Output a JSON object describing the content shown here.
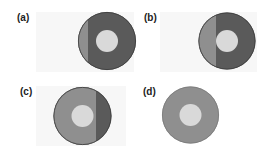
{
  "colors": {
    "dark": "#5a5a5a",
    "medium": "#8f8f8f",
    "inner": "#d9d9d9",
    "outline": "#3a3a3a"
  },
  "panels": [
    {
      "label": "(a)",
      "cx": 107,
      "cy": 41,
      "r": 29,
      "inner_r": 11,
      "split_x": 88,
      "light_side": "left"
    },
    {
      "label": "(b)",
      "cx": 227,
      "cy": 41,
      "r": 28.5,
      "inner_r": 11,
      "split_x": 216,
      "light_side": "left"
    },
    {
      "label": "(c)",
      "cx": 82.5,
      "cy": 116,
      "r": 29,
      "inner_r": 11,
      "split_x": 96,
      "light_side": "left"
    },
    {
      "label": "(d)",
      "cx": 190.5,
      "cy": 115,
      "r": 28.5,
      "inner_r": 11,
      "split_x": null,
      "light_side": "all"
    }
  ]
}
